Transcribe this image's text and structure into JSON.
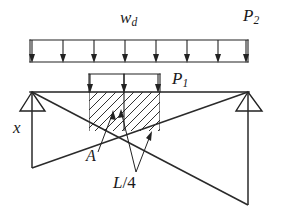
{
  "figure": {
    "type": "structural-engineering-diagram",
    "width": 286,
    "height": 214,
    "background_color": "#ffffff",
    "line_color": "#222222"
  },
  "labels": {
    "distributed_load": {
      "symbol": "w",
      "subscript": "d",
      "text": "wd"
    },
    "point_load_right": {
      "symbol": "P",
      "subscript": "2",
      "text": "P2"
    },
    "point_load_mid": {
      "symbol": "P",
      "subscript": "1",
      "text": "P1"
    },
    "distance_x": {
      "text": "x"
    },
    "area_a": {
      "text": "A"
    },
    "quarter_span": {
      "text": "L/4",
      "numerator": "L",
      "denominator": "4"
    }
  },
  "distributed_load_bar": {
    "name": "distributed-load-wd",
    "left": 30,
    "right": 248,
    "top": 40,
    "bottom": 62,
    "arrow_count": 8,
    "arrow_x_positions": [
      32,
      63,
      94,
      125,
      156,
      187,
      218,
      246
    ]
  },
  "partial_load_bar": {
    "name": "partial-load-p1",
    "left": 89,
    "right": 160,
    "top": 74,
    "bottom": 92,
    "arrow_count": 3,
    "arrow_x_positions": [
      90,
      124,
      158
    ]
  },
  "beam": {
    "name": "beam-axis",
    "y": 92,
    "left": 30,
    "right": 249
  },
  "supports": [
    {
      "name": "support-left",
      "apex_x": 32,
      "apex_y": 92,
      "base_left": 20,
      "base_right": 45,
      "base_y": 111
    },
    {
      "name": "support-right",
      "apex_x": 248,
      "apex_y": 92,
      "base_left": 236,
      "base_right": 262,
      "base_y": 111
    }
  ],
  "hatched_block": {
    "name": "hatched-area-a",
    "left": 89,
    "right": 160,
    "top": 92,
    "bottom": 131,
    "hatch_angle_deg": 45,
    "hatch_spacing": 9
  },
  "influence_lines": {
    "crossing_point": [
      123,
      131
    ],
    "left_vertical": {
      "x": 32,
      "y_top": 92,
      "y_bottom": 168
    },
    "right_vertical": {
      "x": 248,
      "y_top": 92,
      "y_bottom": 205
    },
    "diagonal_1": {
      "from": [
        32,
        92
      ],
      "to": [
        248,
        205
      ]
    },
    "diagonal_2": {
      "from": [
        248,
        92
      ],
      "to": [
        32,
        168
      ]
    }
  },
  "annotations": [
    {
      "name": "leader-a",
      "label": "A",
      "from": [
        98,
        152
      ],
      "to": [
        113,
        112
      ],
      "arrow": true
    },
    {
      "name": "leader-l4",
      "label": "L/4",
      "from": [
        137,
        173
      ],
      "to": [
        121,
        110
      ],
      "arrow": true
    },
    {
      "name": "leader-l4-second",
      "label": "L/4",
      "from": [
        137,
        173
      ],
      "to": [
        152,
        132
      ],
      "arrow": true
    }
  ]
}
